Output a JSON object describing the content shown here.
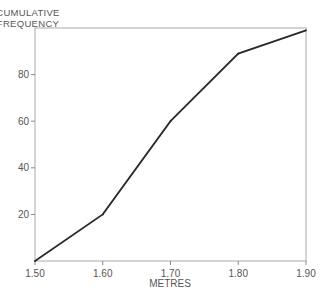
{
  "chart_data": {
    "type": "line",
    "title": "",
    "ylabel": [
      "CUMULATIVE",
      "FREQUENCY"
    ],
    "xlabel": "METRES",
    "x": [
      1.5,
      1.6,
      1.7,
      1.8,
      1.9
    ],
    "series": [
      {
        "name": "cumulative frequency",
        "values": [
          0,
          20,
          60,
          89,
          99
        ]
      }
    ],
    "xlim": [
      1.5,
      1.9
    ],
    "ylim": [
      0,
      100
    ],
    "xticks": [
      1.5,
      1.6,
      1.7,
      1.8,
      1.9
    ],
    "xtick_labels": [
      "1.50",
      "1.60",
      "1.70",
      "1.80",
      "1.90"
    ],
    "yticks": [
      20,
      40,
      60,
      80
    ],
    "ytick_labels": [
      "20",
      "40",
      "60",
      "80"
    ],
    "grid": false,
    "legend": "none",
    "colors": {
      "line": "#2a2a2a",
      "axis": "#999999",
      "text": "#555555"
    }
  }
}
